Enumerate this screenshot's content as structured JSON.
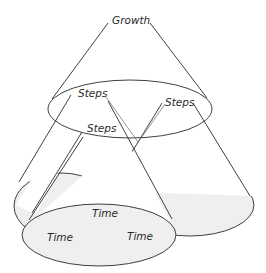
{
  "diagram": {
    "type": "nested-cones",
    "top_label": "Growth",
    "middle_labels": [
      "Steps",
      "Steps",
      "Steps"
    ],
    "bottom_labels": [
      "Time",
      "Time",
      "Time"
    ],
    "colors": {
      "stroke": "#2a2a2a",
      "ellipse_fill": "#efefef",
      "background": "#ffffff"
    }
  }
}
